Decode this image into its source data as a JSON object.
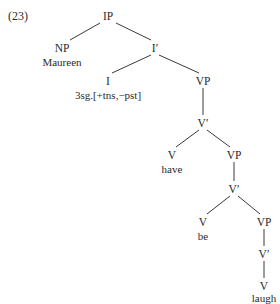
{
  "example_number": "(23)",
  "tree": {
    "root": "IP",
    "nodes": [
      {
        "id": "ip",
        "label": "IP",
        "x": 108,
        "y": 10
      },
      {
        "id": "np",
        "label": "NP",
        "x": 62,
        "y": 42
      },
      {
        "id": "np_word",
        "label": "Maureen",
        "x": 62,
        "y": 56
      },
      {
        "id": "ibar",
        "label": "I′",
        "x": 155,
        "y": 42
      },
      {
        "id": "i",
        "label": "I",
        "x": 108,
        "y": 75
      },
      {
        "id": "i_word",
        "label": "3sg.[+tns,−pst]",
        "x": 108,
        "y": 89
      },
      {
        "id": "vp1",
        "label": "VP",
        "x": 203,
        "y": 75
      },
      {
        "id": "vbar1",
        "label": "V′",
        "x": 203,
        "y": 117
      },
      {
        "id": "v1",
        "label": "V",
        "x": 172,
        "y": 149
      },
      {
        "id": "v1_word",
        "label": "have",
        "x": 172,
        "y": 163
      },
      {
        "id": "vp2",
        "label": "VP",
        "x": 234,
        "y": 149
      },
      {
        "id": "vbar2",
        "label": "V′",
        "x": 234,
        "y": 183
      },
      {
        "id": "v2",
        "label": "V",
        "x": 203,
        "y": 216
      },
      {
        "id": "v2_word",
        "label": "be",
        "x": 203,
        "y": 230
      },
      {
        "id": "vp3",
        "label": "VP",
        "x": 264,
        "y": 216
      },
      {
        "id": "vbar3",
        "label": "V′",
        "x": 264,
        "y": 248
      },
      {
        "id": "v3",
        "label": "V",
        "x": 264,
        "y": 280
      },
      {
        "id": "v3_word",
        "label": "laugh",
        "x": 264,
        "y": 293
      }
    ],
    "edges": [
      {
        "from": "IP",
        "to": "NP",
        "x1": 100,
        "y1": 23,
        "x2": 70,
        "y2": 40
      },
      {
        "from": "IP",
        "to": "I′",
        "x1": 116,
        "y1": 23,
        "x2": 151,
        "y2": 40
      },
      {
        "from": "I′",
        "to": "I",
        "x1": 151,
        "y1": 55,
        "x2": 112,
        "y2": 73
      },
      {
        "from": "I′",
        "to": "VP",
        "x1": 159,
        "y1": 55,
        "x2": 199,
        "y2": 73
      },
      {
        "from": "VP",
        "to": "V′",
        "x1": 203,
        "y1": 88,
        "x2": 203,
        "y2": 115
      },
      {
        "from": "V′",
        "to": "V",
        "x1": 199,
        "y1": 130,
        "x2": 176,
        "y2": 147
      },
      {
        "from": "V′",
        "to": "VP",
        "x1": 207,
        "y1": 130,
        "x2": 230,
        "y2": 147
      },
      {
        "from": "VP",
        "to": "V′",
        "x1": 234,
        "y1": 162,
        "x2": 234,
        "y2": 181
      },
      {
        "from": "V′",
        "to": "V",
        "x1": 230,
        "y1": 196,
        "x2": 207,
        "y2": 214
      },
      {
        "from": "V′",
        "to": "VP",
        "x1": 238,
        "y1": 196,
        "x2": 260,
        "y2": 214
      },
      {
        "from": "VP",
        "to": "V′",
        "x1": 264,
        "y1": 229,
        "x2": 264,
        "y2": 246
      },
      {
        "from": "V′",
        "to": "V",
        "x1": 264,
        "y1": 261,
        "x2": 264,
        "y2": 278
      }
    ]
  }
}
